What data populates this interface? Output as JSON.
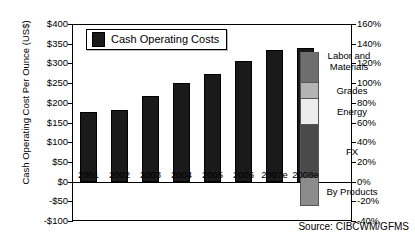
{
  "chart_data": {
    "type": "bar",
    "title": "",
    "xlabel": "",
    "ylabel": "Cash Operating Cost Per Ounce (US$)",
    "categories": [
      "2001",
      "2002",
      "2003",
      "2004",
      "2005",
      "2006",
      "2007e",
      "2008e"
    ],
    "values": [
      176,
      182,
      218,
      249,
      274,
      305,
      333,
      338
    ],
    "series": [
      {
        "name": "Cash Operating Costs",
        "values": [
          176,
          182,
          218,
          249,
          274,
          305,
          333,
          338
        ]
      }
    ],
    "ylim": [
      -100,
      400
    ],
    "yticks": [
      "$400",
      "$350",
      "$300",
      "$250",
      "$200",
      "$150",
      "$100",
      "$50",
      "$0",
      "-$50",
      "-$100"
    ],
    "ytick_values": [
      400,
      350,
      300,
      250,
      200,
      150,
      100,
      50,
      0,
      -50,
      -100
    ],
    "y2label": "",
    "y2lim": [
      -40,
      160
    ],
    "y2ticks": [
      "160%",
      "140%",
      "120%",
      "100%",
      "80%",
      "60%",
      "40%",
      "20%",
      "0%",
      "-20%",
      "-40%"
    ],
    "y2tick_values": [
      160,
      140,
      120,
      100,
      80,
      60,
      40,
      20,
      0,
      -20,
      -40
    ],
    "grid": false,
    "legend_position": "upper-left",
    "legend": [
      {
        "label": "Cash Operating Costs",
        "color": "#1a1a1a"
      }
    ],
    "cost_breakdown": {
      "type": "stacked-bar",
      "axis": "right-percent",
      "segments": [
        {
          "label": "Labor and Materials",
          "color": "#6e6e6e",
          "from": 100,
          "to": 132
        },
        {
          "label": "Grades",
          "color": "#b3b3b3",
          "from": 84,
          "to": 100
        },
        {
          "label": "Energy",
          "color": "#ececec",
          "from": 57,
          "to": 84
        },
        {
          "label": "FX",
          "color": "#4a4a4a",
          "from": 4,
          "to": 57
        },
        {
          "label": "By Products",
          "color": "#8c8c8c",
          "from": -25,
          "to": 4
        }
      ]
    },
    "source": "Source: CIBCWM/GFMS"
  },
  "colors": {
    "bar": "#1a1a1a",
    "axis": "#000000",
    "background": "#ffffff",
    "labor_and_materials": "#6e6e6e",
    "grades": "#b3b3b3",
    "energy": "#ececec",
    "fx": "#4a4a4a",
    "by_products": "#8c8c8c"
  }
}
